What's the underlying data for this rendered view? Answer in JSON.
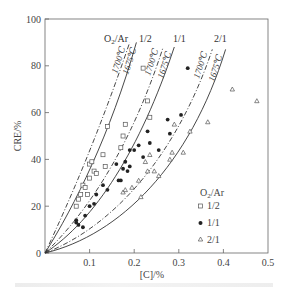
{
  "chart_data": {
    "type": "scatter",
    "title": "",
    "xlabel": "[C]/%",
    "ylabel": "CRE/%",
    "xlim": [
      0,
      0.5
    ],
    "ylim": [
      0,
      100
    ],
    "x_ticks": [
      "0.1",
      "0.2",
      "0.3",
      "0.4",
      "0.5"
    ],
    "y_ticks": [
      "0",
      "20",
      "40",
      "60",
      "80",
      "100"
    ],
    "grid": false,
    "legend": {
      "title": "O2/Ar",
      "position": "lower right",
      "entries": [
        {
          "label": "1/2",
          "marker": "open-square"
        },
        {
          "label": "1/1",
          "marker": "filled-circle"
        },
        {
          "label": "2/1",
          "marker": "open-triangle"
        }
      ]
    },
    "curve_group_header": "O2/Ar",
    "curve_groups": [
      {
        "ratio": "1/2",
        "curves": [
          {
            "label": "1700℃",
            "style": "dash-dot",
            "end": [
              0.19,
              90
            ]
          },
          {
            "label": "1675℃",
            "style": "solid",
            "end": [
              0.205,
              90
            ]
          }
        ]
      },
      {
        "ratio": "1/1",
        "curves": [
          {
            "label": "1700℃",
            "style": "dash-dot",
            "end": [
              0.265,
              88
            ]
          },
          {
            "label": "1675℃",
            "style": "solid",
            "end": [
              0.29,
              88
            ]
          }
        ]
      },
      {
        "ratio": "2/1",
        "curves": [
          {
            "label": "1700℃",
            "style": "dash-dot",
            "end": [
              0.375,
              87
            ]
          },
          {
            "label": "1675℃",
            "style": "solid",
            "end": [
              0.405,
              87
            ]
          }
        ]
      }
    ],
    "series": [
      {
        "name": "1/2",
        "marker": "open-square",
        "points": [
          [
            0.07,
            20
          ],
          [
            0.075,
            23
          ],
          [
            0.08,
            25
          ],
          [
            0.085,
            29
          ],
          [
            0.09,
            28
          ],
          [
            0.095,
            25
          ],
          [
            0.1,
            38
          ],
          [
            0.1,
            32
          ],
          [
            0.105,
            39
          ],
          [
            0.11,
            35
          ],
          [
            0.115,
            34
          ],
          [
            0.13,
            42
          ],
          [
            0.135,
            37
          ],
          [
            0.14,
            54
          ],
          [
            0.17,
            45
          ],
          [
            0.175,
            50
          ],
          [
            0.18,
            55
          ],
          [
            0.22,
            79
          ],
          [
            0.23,
            65
          ],
          [
            0.235,
            58
          ]
        ]
      },
      {
        "name": "1/1",
        "marker": "filled-circle",
        "points": [
          [
            0.07,
            14
          ],
          [
            0.07,
            13
          ],
          [
            0.075,
            12
          ],
          [
            0.085,
            11
          ],
          [
            0.09,
            16
          ],
          [
            0.1,
            20
          ],
          [
            0.11,
            21
          ],
          [
            0.115,
            25
          ],
          [
            0.13,
            29
          ],
          [
            0.14,
            27
          ],
          [
            0.16,
            38
          ],
          [
            0.165,
            31
          ],
          [
            0.17,
            31
          ],
          [
            0.175,
            36
          ],
          [
            0.18,
            39
          ],
          [
            0.185,
            35
          ],
          [
            0.19,
            44
          ],
          [
            0.19,
            37
          ],
          [
            0.2,
            44
          ],
          [
            0.21,
            46
          ],
          [
            0.22,
            41
          ],
          [
            0.23,
            52
          ],
          [
            0.235,
            47
          ],
          [
            0.255,
            44
          ],
          [
            0.275,
            57
          ],
          [
            0.28,
            51
          ],
          [
            0.305,
            59
          ],
          [
            0.32,
            79
          ]
        ]
      },
      {
        "name": "2/1",
        "marker": "open-triangle",
        "points": [
          [
            0.175,
            26
          ],
          [
            0.18,
            27
          ],
          [
            0.195,
            28
          ],
          [
            0.21,
            31
          ],
          [
            0.215,
            24
          ],
          [
            0.225,
            39
          ],
          [
            0.23,
            35
          ],
          [
            0.235,
            42
          ],
          [
            0.245,
            35
          ],
          [
            0.255,
            33
          ],
          [
            0.28,
            40
          ],
          [
            0.285,
            43
          ],
          [
            0.29,
            55
          ],
          [
            0.31,
            43
          ],
          [
            0.325,
            52
          ],
          [
            0.365,
            56
          ],
          [
            0.42,
            70
          ],
          [
            0.475,
            65
          ]
        ]
      }
    ]
  },
  "labels": {
    "y_axis": "CRE/%",
    "x_axis": "[C]/%",
    "legend_title_main": "O",
    "legend_title_sub": "2",
    "legend_title_tail": "/Ar",
    "top_header_main": "O",
    "top_header_sub": "2",
    "top_header_tail": "/Ar",
    "ratio_half": "1/2",
    "ratio_one": "1/1",
    "ratio_two": "2/1",
    "temp_high": "1700℃",
    "temp_low": "1675℃",
    "tick_y_0": "0",
    "tick_y_20": "20",
    "tick_y_40": "40",
    "tick_y_60": "60",
    "tick_y_80": "80",
    "tick_y_100": "100",
    "tick_x_1": "0.1",
    "tick_x_2": "0.2",
    "tick_x_3": "0.3",
    "tick_x_4": "0.4",
    "tick_x_5": "0.5"
  },
  "colors": {
    "axis": "#555555",
    "curve": "#333333",
    "marker": "#555555",
    "marker_fill": "#222222"
  }
}
